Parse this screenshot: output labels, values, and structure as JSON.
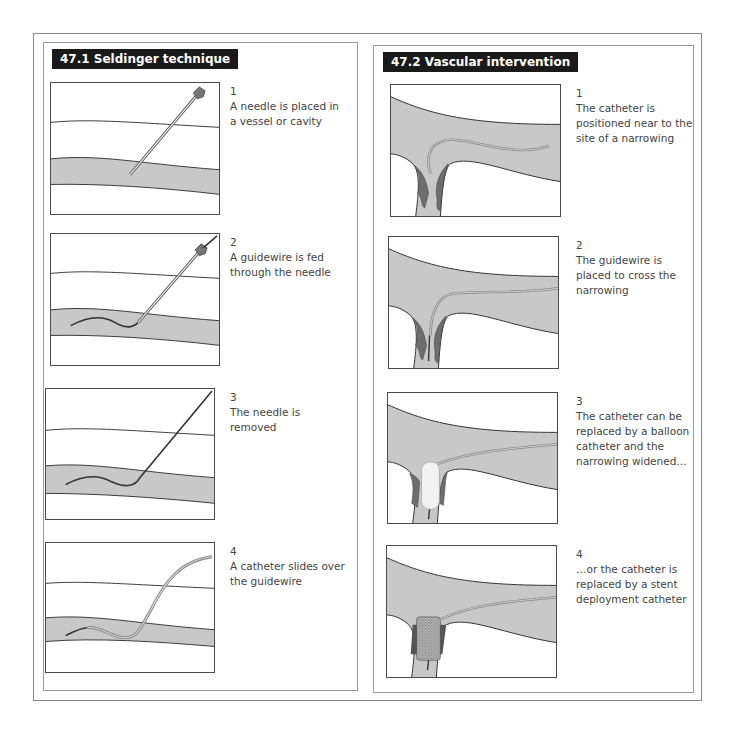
{
  "panels": {
    "left": {
      "title": "47.1 Seldinger technique",
      "steps": [
        {
          "number": "1",
          "text": "A needle is placed in a vessel or cavity"
        },
        {
          "number": "2",
          "text": "A guidewire is fed through the needle"
        },
        {
          "number": "3",
          "text": "The needle is removed"
        },
        {
          "number": "4",
          "text": "A catheter slides over the guidewire"
        }
      ]
    },
    "right": {
      "title": "47.2 Vascular intervention",
      "steps": [
        {
          "number": "1",
          "text": "The catheter is positioned near to the site of a narrowing"
        },
        {
          "number": "2",
          "text": "The guidewire is placed to cross the narrowing"
        },
        {
          "number": "3",
          "text": "The catheter can be replaced by a balloon catheter and the narrowing widened…"
        },
        {
          "number": "4",
          "text": "…or the catheter is replaced by a stent deployment catheter"
        }
      ]
    }
  },
  "colors": {
    "title_bg": "#1a1a1a",
    "vessel_fill": "#c8c8c8",
    "plaque_fill": "#6e6e6e",
    "outline": "#3a3a3a"
  }
}
